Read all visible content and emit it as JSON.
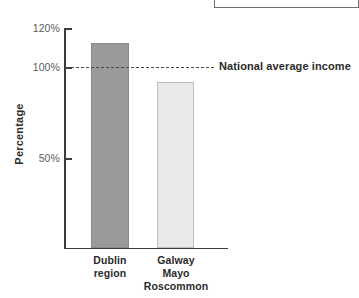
{
  "chart_data": {
    "type": "bar",
    "title": "",
    "xlabel": "",
    "ylabel": "Percentage",
    "categories": [
      "Dublin region",
      "Galway Mayo Roscommon"
    ],
    "values": [
      113,
      92
    ],
    "ylim": [
      0,
      120
    ],
    "yticks": [
      50,
      100,
      120
    ],
    "ytick_labels": [
      "50%",
      "100%",
      "120%"
    ],
    "grid": false,
    "legend": "none",
    "series": [
      {
        "name": "Percentage",
        "values": [
          113,
          92
        ],
        "colors": [
          "#9a9a9a",
          "#e9e9e9"
        ]
      }
    ],
    "annotations": [
      {
        "type": "hline",
        "value": 100,
        "label": "National average income",
        "style": "dashed"
      }
    ]
  },
  "axes": {
    "y_title": "Percentage",
    "ticks": [
      {
        "label": "120%",
        "value": 120
      },
      {
        "label": "100%",
        "value": 100
      },
      {
        "label": "50%",
        "value": 50
      }
    ]
  },
  "categories": [
    {
      "line1": "Dublin",
      "line2": "region",
      "line3": ""
    },
    {
      "line1": "Galway",
      "line2": "Mayo",
      "line3": "Roscommon"
    }
  ],
  "annotation": {
    "average_label": "National average income"
  },
  "colors": {
    "bar_dublin": "#9a9a9a",
    "bar_gmr": "#e9e9e9",
    "axis": "#3b3b3b",
    "text": "#2b2b2b",
    "tick_text": "#5c5c5c"
  }
}
